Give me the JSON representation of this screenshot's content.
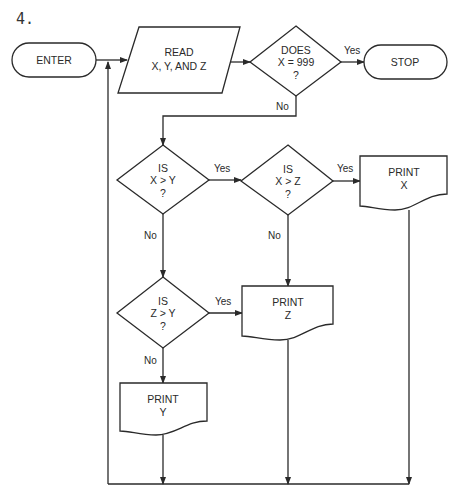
{
  "problem_number": "4.",
  "nodes": {
    "enter": {
      "label": "ENTER"
    },
    "read": {
      "line1": "READ",
      "line2": "X, Y, AND Z"
    },
    "does999": {
      "line1": "DOES",
      "line2": "X = 999",
      "line3": "?"
    },
    "stop": {
      "label": "STOP"
    },
    "x_gt_y": {
      "line1": "IS",
      "line2": "X > Y",
      "line3": "?"
    },
    "x_gt_z": {
      "line1": "IS",
      "line2": "X > Z",
      "line3": "?"
    },
    "z_gt_y": {
      "line1": "IS",
      "line2": "Z > Y",
      "line3": "?"
    },
    "print_x": {
      "line1": "PRINT",
      "line2": "X"
    },
    "print_z": {
      "line1": "PRINT",
      "line2": "Z"
    },
    "print_y": {
      "line1": "PRINT",
      "line2": "Y"
    }
  },
  "edges": {
    "does_yes": "Yes",
    "does_no": "No",
    "xy_yes": "Yes",
    "xy_no": "No",
    "xz_yes": "Yes",
    "xz_no": "No",
    "zy_yes": "Yes",
    "zy_no": "No"
  }
}
